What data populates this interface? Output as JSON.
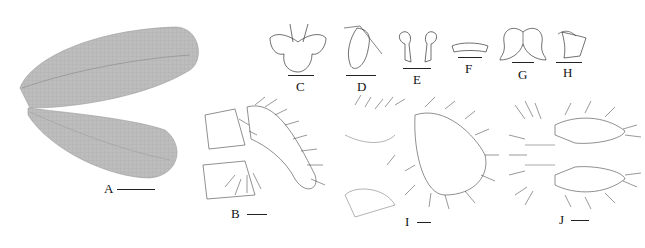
{
  "figure": {
    "panels": [
      {
        "id": "A",
        "label": "A",
        "description": "forewing and hindwing"
      },
      {
        "id": "B",
        "label": "B",
        "description": "genital segments, lateral view"
      },
      {
        "id": "C",
        "label": "C",
        "description": "structure, ventral view"
      },
      {
        "id": "D",
        "label": "D",
        "description": "structure, lateral view"
      },
      {
        "id": "E",
        "label": "E",
        "description": "paired sclerites"
      },
      {
        "id": "F",
        "label": "F",
        "description": "transverse sclerite"
      },
      {
        "id": "G",
        "label": "G",
        "description": "bilobed structure"
      },
      {
        "id": "H",
        "label": "H",
        "description": "sclerite lateral view"
      },
      {
        "id": "I",
        "label": "I",
        "description": "terminalia, lateral view"
      },
      {
        "id": "J",
        "label": "J",
        "description": "terminalia, dorsal view"
      }
    ],
    "colors": {
      "wing": "#b9b9b9",
      "wing_vein": "#8a8a8a",
      "line": "#333333",
      "background": "#ffffff"
    }
  }
}
